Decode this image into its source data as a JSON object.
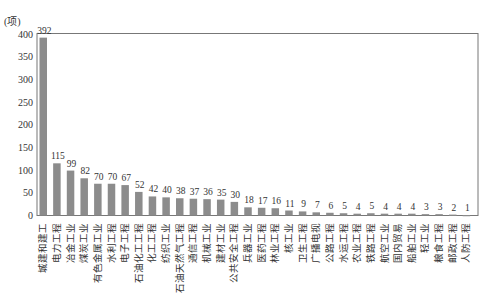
{
  "chart_data": {
    "type": "bar",
    "title": "",
    "xlabel": "",
    "ylabel": "(项)",
    "ylim": [
      0,
      400
    ],
    "yticks": [
      0,
      50,
      100,
      150,
      200,
      250,
      300,
      350,
      400
    ],
    "grid": false,
    "legend": null,
    "bar_color": "#8c8c8c",
    "categories": [
      "城建和建工",
      "电力工程",
      "冶金工业",
      "煤炭工业",
      "有色金属工业",
      "水利工程",
      "电子工程",
      "石油化工工程",
      "化工工程",
      "纺织工业",
      "石油天然气工程",
      "通信工程",
      "机械工业",
      "建材工业",
      "公共安全工程",
      "兵器工业",
      "医药工程",
      "林业工程",
      "核工业",
      "卫生工程",
      "广播电视",
      "公路工程",
      "水运工程",
      "农业工程",
      "铁路工程",
      "航空工业",
      "国内贸易",
      "船舶工业",
      "轻工业",
      "粮食工程",
      "邮政工程",
      "人防工程"
    ],
    "values": [
      392,
      115,
      99,
      82,
      70,
      70,
      67,
      52,
      42,
      40,
      38,
      37,
      36,
      35,
      30,
      18,
      17,
      16,
      11,
      9,
      7,
      6,
      5,
      4,
      5,
      4,
      4,
      4,
      3,
      3,
      2,
      1
    ]
  }
}
